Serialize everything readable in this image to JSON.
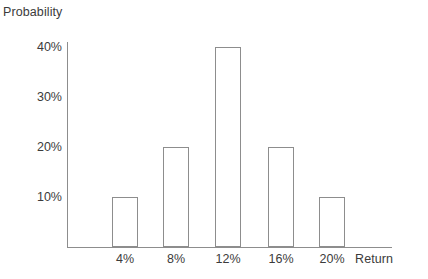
{
  "chart_data": {
    "type": "bar",
    "title": "",
    "xlabel": "Return",
    "ylabel": "Probability",
    "categories": [
      "4%",
      "8%",
      "12%",
      "16%",
      "20%"
    ],
    "values": [
      10,
      20,
      40,
      20,
      10
    ],
    "value_labels": [
      "10%",
      "20%",
      "40%",
      "20%",
      "10%"
    ],
    "ylim": [
      0,
      45
    ],
    "yticks": [
      10,
      20,
      30,
      40
    ],
    "ytick_labels": [
      "10%",
      "20%",
      "30%",
      "40%"
    ],
    "xtick_labels": [
      "4%",
      "8%",
      "12%",
      "16%",
      "20%"
    ],
    "grid": false,
    "legend": null,
    "bar_fill": "#ffffff",
    "bar_edge": "#8d8d8d",
    "axis_color": "#8d8d8d",
    "text_color": "#3b3b3b"
  },
  "labels": {
    "y_axis_title": "Probability",
    "x_axis_title": "Return"
  }
}
